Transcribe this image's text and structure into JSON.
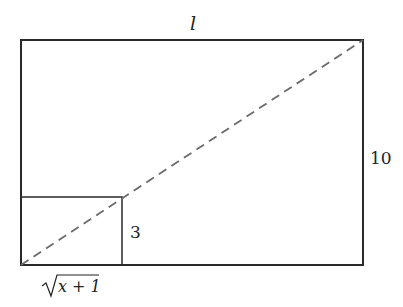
{
  "diagram": {
    "labels": {
      "top_length": "l",
      "right_height": "10",
      "small_height": "3",
      "small_width_radicand": "x + 1"
    },
    "colors": {
      "stroke": "#2a2a2a",
      "dashed": "#6b6b6b",
      "background": "#ffffff"
    }
  }
}
